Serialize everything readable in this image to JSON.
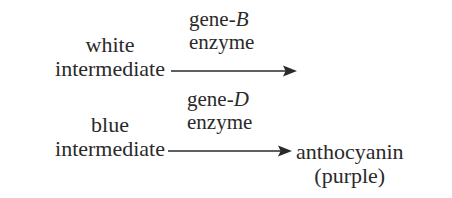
{
  "diagram": {
    "background_color": "#ffffff",
    "text_color": "#2a2a2a",
    "steps": [
      {
        "substrate": {
          "line1": "white",
          "line2": "intermediate"
        },
        "enzyme": {
          "gene_prefix": "gene-",
          "gene_letter": "B",
          "line2": "enzyme"
        },
        "arrow": {
          "direction": "right",
          "glyph": "→"
        },
        "product": null
      },
      {
        "substrate": {
          "line1": "blue",
          "line2": "intermediate"
        },
        "enzyme": {
          "gene_prefix": "gene-",
          "gene_letter": "D",
          "line2": "enzyme"
        },
        "arrow": {
          "direction": "right",
          "glyph": "→"
        },
        "product": {
          "line1": "anthocyanin",
          "line2": "(purple)"
        }
      }
    ]
  }
}
